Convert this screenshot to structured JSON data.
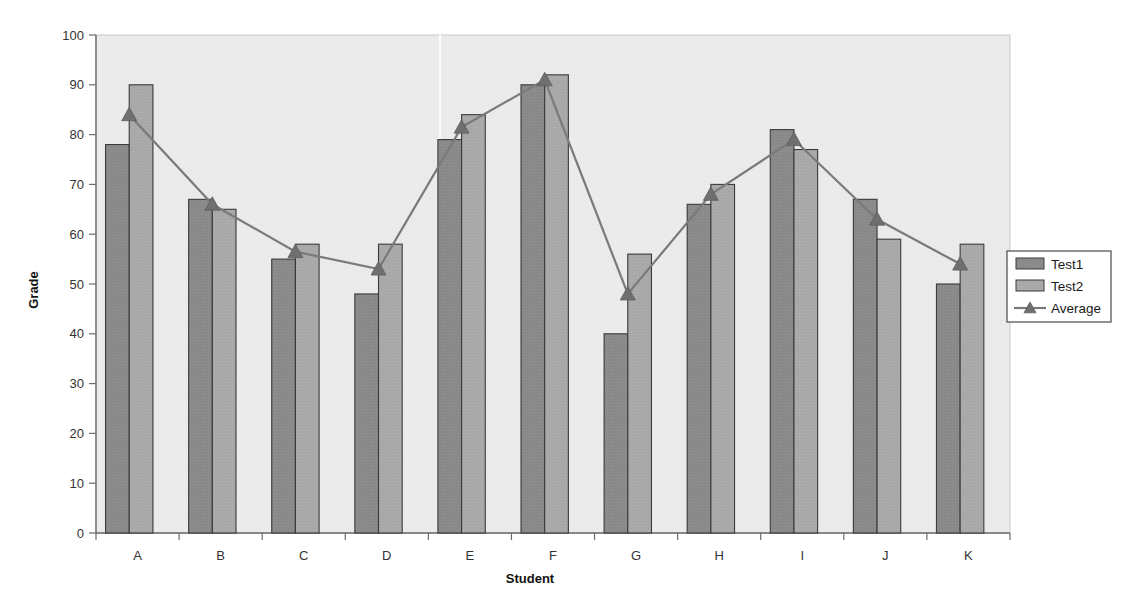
{
  "chart_data": {
    "type": "bar",
    "title": "",
    "subtitle": "",
    "xlabel": "Student",
    "ylabel": "Grade",
    "categories": [
      "A",
      "B",
      "C",
      "D",
      "E",
      "F",
      "G",
      "H",
      "I",
      "J",
      "K"
    ],
    "series": [
      {
        "name": "Test1",
        "type": "bar",
        "color": "#8d8d8d",
        "values": [
          78,
          67,
          55,
          48,
          79,
          90,
          40,
          66,
          81,
          67,
          50
        ]
      },
      {
        "name": "Test2",
        "type": "bar",
        "color": "#ababab",
        "values": [
          90,
          65,
          58,
          58,
          84,
          92,
          56,
          70,
          77,
          59,
          58
        ]
      },
      {
        "name": "Average",
        "type": "line",
        "color": "#7a7a7a",
        "marker": "triangle",
        "values": [
          84,
          66,
          56.5,
          53,
          81.5,
          91,
          48,
          68,
          79,
          63,
          54
        ]
      }
    ],
    "ylim": [
      0,
      100
    ],
    "ytick_step": 10,
    "yticks": [
      0,
      10,
      20,
      30,
      40,
      50,
      60,
      70,
      80,
      90,
      100
    ],
    "grid": false,
    "legend_position": "right",
    "plot_background": "#ebebeb",
    "axis_color": "#555555",
    "bar_border_color": "#3a3a3a"
  },
  "axes": {
    "y_title": "Grade",
    "x_title": "Student"
  },
  "legend": {
    "items": [
      {
        "label": "Test1",
        "swatch": "#8d8d8d",
        "kind": "bar"
      },
      {
        "label": "Test2",
        "swatch": "#ababab",
        "kind": "bar"
      },
      {
        "label": "Average",
        "swatch": "#7a7a7a",
        "kind": "line"
      }
    ]
  }
}
